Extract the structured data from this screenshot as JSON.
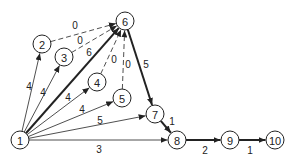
{
  "diagram": {
    "type": "network",
    "nodes": [
      {
        "id": "1",
        "label": "1",
        "x": 20,
        "y": 140
      },
      {
        "id": "2",
        "label": "2",
        "x": 42,
        "y": 44
      },
      {
        "id": "3",
        "label": "3",
        "x": 64,
        "y": 57
      },
      {
        "id": "4",
        "label": "4",
        "x": 97,
        "y": 82
      },
      {
        "id": "5",
        "label": "5",
        "x": 122,
        "y": 98
      },
      {
        "id": "6",
        "label": "6",
        "x": 125,
        "y": 21
      },
      {
        "id": "7",
        "label": "7",
        "x": 155,
        "y": 114
      },
      {
        "id": "8",
        "label": "8",
        "x": 177,
        "y": 140
      },
      {
        "id": "9",
        "label": "9",
        "x": 230,
        "y": 140
      },
      {
        "id": "10",
        "label": "10",
        "x": 275,
        "y": 140
      }
    ],
    "edges": [
      {
        "from": "1",
        "to": "2",
        "label": "4",
        "style": "solid",
        "bold": false,
        "lx": 29,
        "ly": 86
      },
      {
        "from": "1",
        "to": "3",
        "label": "4",
        "style": "solid",
        "bold": false,
        "lx": 43,
        "ly": 92
      },
      {
        "from": "1",
        "to": "6",
        "label": "6",
        "style": "solid",
        "bold": true,
        "lx": 89,
        "ly": 52
      },
      {
        "from": "1",
        "to": "4",
        "label": "4",
        "style": "solid",
        "bold": false,
        "lx": 68,
        "ly": 97
      },
      {
        "from": "1",
        "to": "5",
        "label": "4",
        "style": "solid",
        "bold": false,
        "lx": 82,
        "ly": 109
      },
      {
        "from": "1",
        "to": "7",
        "label": "5",
        "style": "solid",
        "bold": false,
        "lx": 100,
        "ly": 120
      },
      {
        "from": "1",
        "to": "8",
        "label": "3",
        "style": "solid",
        "bold": false,
        "lx": 99,
        "ly": 149
      },
      {
        "from": "2",
        "to": "6",
        "label": "0",
        "style": "dashed",
        "bold": false,
        "lx": 75,
        "ly": 25
      },
      {
        "from": "3",
        "to": "6",
        "label": "0",
        "style": "dashed",
        "bold": false,
        "lx": 80,
        "ly": 40
      },
      {
        "from": "4",
        "to": "6",
        "label": "0",
        "style": "dashed",
        "bold": false,
        "lx": 114,
        "ly": 59
      },
      {
        "from": "5",
        "to": "6",
        "label": "0",
        "style": "dashed",
        "bold": false,
        "lx": 128,
        "ly": 64
      },
      {
        "from": "6",
        "to": "7",
        "label": "5",
        "style": "solid",
        "bold": true,
        "lx": 146,
        "ly": 64
      },
      {
        "from": "7",
        "to": "8",
        "label": "1",
        "style": "solid",
        "bold": true,
        "lx": 172,
        "ly": 121
      },
      {
        "from": "8",
        "to": "9",
        "label": "2",
        "style": "solid",
        "bold": true,
        "lx": 205,
        "ly": 150
      },
      {
        "from": "9",
        "to": "10",
        "label": "1",
        "style": "solid",
        "bold": true,
        "lx": 250,
        "ly": 150
      }
    ],
    "node_radius": 9,
    "colors": {
      "line": "#222222",
      "background": "#ffffff"
    }
  }
}
